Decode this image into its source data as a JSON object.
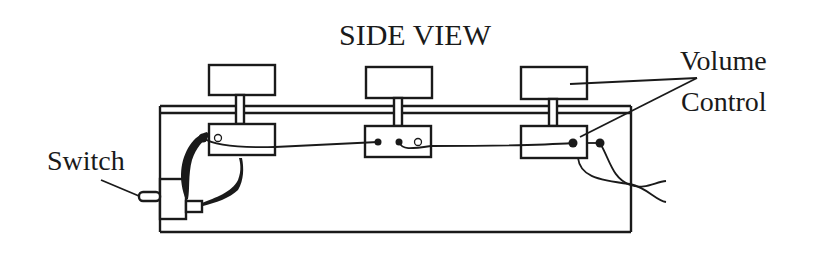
{
  "diagram": {
    "title": "SIDE VIEW",
    "labels": {
      "switch": "Switch",
      "volume_control_line1": "Volume",
      "volume_control_line2": "Control"
    },
    "components": [
      {
        "name": "knob",
        "count": 3
      },
      {
        "name": "potentiometer",
        "count": 3
      },
      {
        "name": "switch",
        "count": 1
      },
      {
        "name": "enclosure",
        "count": 1
      }
    ],
    "colors": {
      "ink": "#1a1a1a",
      "background": "#ffffff"
    }
  }
}
